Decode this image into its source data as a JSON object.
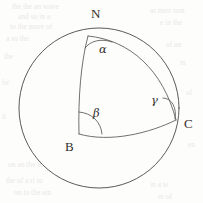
{
  "figure": {
    "type": "spherical-triangle-diagram",
    "caption_visible": false,
    "sphere": {
      "name": "sphere-outline",
      "center_x": 99,
      "center_y": 108,
      "radius": 80
    },
    "vertices": [
      {
        "id": "N",
        "label": "N",
        "x": 88,
        "y": 36,
        "label_x": 91,
        "label_y": 7
      },
      {
        "id": "B",
        "label": "B",
        "x": 79,
        "y": 134,
        "label_x": 65,
        "label_y": 140
      },
      {
        "id": "C",
        "label": "C",
        "x": 176,
        "y": 120,
        "label_x": 184,
        "label_y": 117
      }
    ],
    "angles": [
      {
        "id": "alpha",
        "label": "α",
        "at_vertex": "N",
        "x": 99,
        "y": 44
      },
      {
        "id": "beta",
        "label": "β",
        "at_vertex": "B",
        "x": 93,
        "y": 108
      },
      {
        "id": "gamma",
        "label": "γ",
        "at_vertex": "C",
        "x": 151,
        "y": 95
      }
    ],
    "arcs": [
      {
        "id": "arc-NB",
        "from": "N",
        "to": "B",
        "name": "meridian-arc-north-to-b"
      },
      {
        "id": "arc-NC",
        "from": "N",
        "to": "C",
        "name": "great-circle-arc-north-to-c"
      },
      {
        "id": "arc-BC",
        "from": "B",
        "to": "C",
        "name": "great-circle-arc-b-to-c"
      }
    ]
  },
  "ghost_text": {
    "note": "faint bleed-through text from reverse of scanned page",
    "lines": [
      {
        "text": "the the an wave",
        "x": 12,
        "y": 2
      },
      {
        "text": "and so in a",
        "x": 18,
        "y": 12
      },
      {
        "text": "to the more of",
        "x": 10,
        "y": 22
      },
      {
        "text": "as men tion",
        "x": 150,
        "y": 6
      },
      {
        "text": "e in the",
        "x": 160,
        "y": 18
      },
      {
        "text": "a so the",
        "x": 6,
        "y": 34
      },
      {
        "text": "of an",
        "x": 166,
        "y": 40
      },
      {
        "text": "the",
        "x": 4,
        "y": 52
      },
      {
        "text": "in",
        "x": 180,
        "y": 58
      },
      {
        "text": "he",
        "x": 2,
        "y": 78
      },
      {
        "text": "of",
        "x": 186,
        "y": 88
      },
      {
        "text": "ti",
        "x": 2,
        "y": 112
      },
      {
        "text": "en",
        "x": 188,
        "y": 140
      },
      {
        "text": "on an the le",
        "x": 8,
        "y": 160
      },
      {
        "text": "the of a ri to",
        "x": 6,
        "y": 176
      },
      {
        "text": "on to the ain",
        "x": 14,
        "y": 188
      },
      {
        "text": "in a te",
        "x": 150,
        "y": 180
      },
      {
        "text": "re of",
        "x": 158,
        "y": 192
      }
    ]
  }
}
